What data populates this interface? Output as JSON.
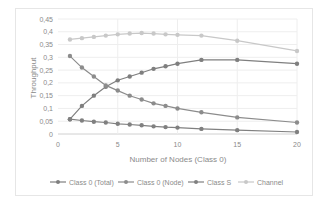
{
  "chart_data": {
    "type": "line",
    "title": "",
    "xlabel": "Number of Nodes (Class 0)",
    "ylabel": "Throughput",
    "xlim": [
      0,
      20
    ],
    "ylim": [
      0,
      0.45
    ],
    "x_ticks": [
      "0",
      "5",
      "10",
      "15",
      "20"
    ],
    "y_ticks": [
      "0",
      "0,05",
      "0,1",
      "0,15",
      "0,2",
      "0,25",
      "0,3",
      "0,35",
      "0,4",
      "0,45"
    ],
    "grid": true,
    "legend_position": "bottom",
    "x": [
      1,
      2,
      3,
      4,
      5,
      6,
      7,
      8,
      9,
      10,
      12,
      15,
      20
    ],
    "series": [
      {
        "name": "Class 0 (Total)",
        "color": "#7f7f7f",
        "values": [
          0.058,
          0.11,
          0.15,
          0.185,
          0.21,
          0.225,
          0.24,
          0.255,
          0.265,
          0.275,
          0.29,
          0.29,
          0.275
        ]
      },
      {
        "name": "Class 0 (Node)",
        "color": "#8c8c8c",
        "values": [
          0.305,
          0.26,
          0.225,
          0.19,
          0.17,
          0.15,
          0.135,
          0.12,
          0.11,
          0.1,
          0.085,
          0.065,
          0.045
        ]
      },
      {
        "name": "Class S",
        "color": "#808080",
        "values": [
          0.058,
          0.053,
          0.048,
          0.045,
          0.04,
          0.037,
          0.034,
          0.03,
          0.027,
          0.025,
          0.02,
          0.015,
          0.008
        ]
      },
      {
        "name": "Channel",
        "color": "#c8c8c8",
        "values": [
          0.37,
          0.375,
          0.38,
          0.385,
          0.39,
          0.393,
          0.395,
          0.393,
          0.39,
          0.388,
          0.385,
          0.365,
          0.325
        ]
      }
    ]
  }
}
